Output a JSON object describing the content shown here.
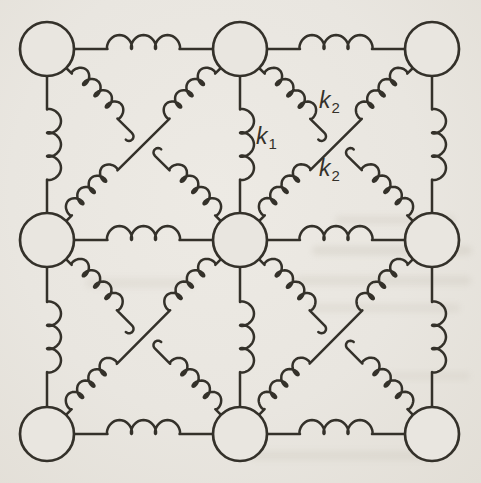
{
  "figure": {
    "paper_color": "#e9e6e0",
    "ink_color": "#34312a",
    "labels": [
      {
        "base": "k",
        "sub": "1"
      },
      {
        "base": "k",
        "sub": "2"
      },
      {
        "base": "k",
        "sub": "2"
      }
    ],
    "lattice": {
      "rows": 3,
      "cols": 3,
      "cols_x": [
        47,
        240,
        432
      ],
      "rows_y": [
        49,
        240,
        434
      ],
      "mass_radius": 27,
      "springs": {
        "horizontal": {
          "loops": 3,
          "coil_length": 72,
          "loop_rx": 5,
          "loop_ry": 7
        },
        "vertical": {
          "loops": 3,
          "coil_length": 70,
          "loop_rx": 5,
          "loop_ry": 7
        },
        "diagonal": {
          "loops": 4,
          "coil_length": 64,
          "lead": 8,
          "loop_rx": 4.5,
          "loop_ry": 6.5,
          "center_gap": 16,
          "hook_radius": 4.5
        },
        "continuous_diagonal": "ne-sw",
        "broken_diagonal": "nw-se"
      },
      "stroke_width_spring": 2.5,
      "stroke_width_mass": 2.7
    }
  }
}
